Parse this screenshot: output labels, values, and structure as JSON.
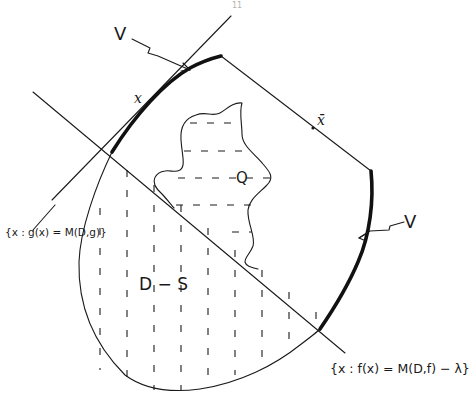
{
  "figure": {
    "page_number": "11",
    "labels": {
      "v_top": "V",
      "v_right": "V",
      "x_point": "x",
      "x_bar_point": "x̄",
      "region_q": "Q",
      "region_d_minus_s": "D − S",
      "level_set_g": "{x : g(x) = M(D,g)}",
      "level_set_f": "{x : f(x) = M(D,f) − λ}"
    },
    "colors": {
      "ink": "#1a1a1a",
      "background": "#ffffff"
    }
  }
}
